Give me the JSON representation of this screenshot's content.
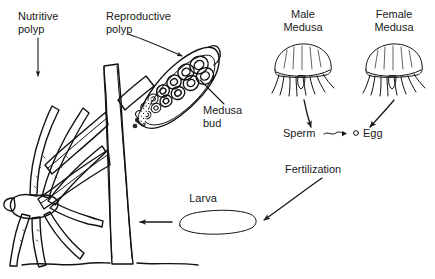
{
  "figure": {
    "background_color": "#ffffff",
    "ink_color": "#111111",
    "text_color": "#1a1a1a",
    "width": 435,
    "height": 279
  },
  "labels": {
    "nutritive_polyp_line1": "Nutritive",
    "nutritive_polyp_line2": "polyp",
    "reproductive_polyp_line1": "Reproductive",
    "reproductive_polyp_line2": "polyp",
    "medusa_bud_line1": "Medusa",
    "medusa_bud_line2": "bud",
    "male_medusa_line1": "Male",
    "male_medusa_line2": "Medusa",
    "female_medusa_line1": "Female",
    "female_medusa_line2": "Medusa",
    "sperm": "Sperm",
    "egg": "Egg",
    "fertilization": "Fertilization",
    "larva": "Larva"
  },
  "icons": {
    "nutritive_polyp": "tentacled-polyp-icon",
    "reproductive_polyp": "gonangium-icon",
    "medusa_bud": "medusa-bud-cluster-icon",
    "male_medusa": "jellyfish-icon",
    "female_medusa": "jellyfish-icon",
    "sperm_cell": "sperm-squiggle-icon",
    "egg_cell": "egg-circle-icon",
    "larva": "planula-larva-icon",
    "colony_stalk": "branching-stalk-icon",
    "substrate": "substrate-line-icon"
  },
  "arrows": [
    {
      "name": "nutritive-polyp-leader",
      "from": "Nutritive polyp label",
      "to": "tentacled polyp"
    },
    {
      "name": "reproductive-polyp-leader",
      "from": "Reproductive polyp label",
      "to": "gonangium"
    },
    {
      "name": "medusa-bud-leader",
      "from": "Medusa bud label",
      "to": "medusa bud cluster"
    },
    {
      "name": "male-medusa-to-sperm-arrow",
      "from": "Male Medusa",
      "to": "Sperm"
    },
    {
      "name": "female-medusa-to-egg-arrow",
      "from": "Female Medusa",
      "to": "Egg"
    },
    {
      "name": "sperm-to-egg-arrow",
      "from": "Sperm",
      "to": "Egg"
    },
    {
      "name": "fertilization-to-larva-arrow",
      "from": "Fertilization",
      "to": "Larva"
    },
    {
      "name": "larva-to-colony-arrow",
      "from": "Larva",
      "to": "colony stalk"
    }
  ]
}
